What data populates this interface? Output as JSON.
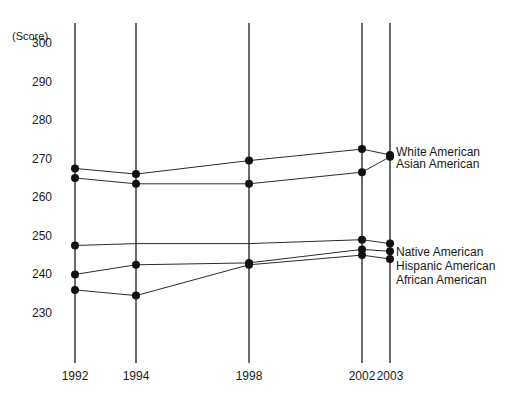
{
  "chart_data": {
    "type": "line",
    "title": "",
    "xlabel": "",
    "ylabel": "(Score)",
    "unit_label": "(Score)",
    "categories": [
      "1992",
      "1994",
      "1998",
      "2002",
      "2003"
    ],
    "x_tick_labels": [
      "1992",
      "1994",
      "1998",
      "2002",
      "2003"
    ],
    "y_tick_labels": [
      "300",
      "290",
      "280",
      "270",
      "260",
      "250",
      "240",
      "230"
    ],
    "y_ticks": [
      300,
      290,
      280,
      270,
      260,
      250,
      240,
      230
    ],
    "ylim": [
      226,
      303
    ],
    "xlim": [
      "1992",
      "2003"
    ],
    "grid": "vertical-axis-lines",
    "legend": "right-of-plot-inline",
    "marker": "filled-circle",
    "series": [
      {
        "name": "White American",
        "label": "White American",
        "x": [
          "1992",
          "1994",
          "1998",
          "2002",
          "2003"
        ],
        "values": [
          267.5,
          266.0,
          269.5,
          272.5,
          271.0
        ],
        "markers": [
          true,
          true,
          true,
          true,
          true
        ]
      },
      {
        "name": "Asian American",
        "label": "Asian American",
        "x": [
          "1992",
          "1994",
          "1998",
          "2002",
          "2003"
        ],
        "values": [
          265.0,
          263.5,
          263.5,
          266.5,
          270.5
        ],
        "markers": [
          true,
          true,
          true,
          true,
          true
        ]
      },
      {
        "name": "Native American",
        "label": "Native American",
        "x": [
          "1992",
          "1994",
          "1998",
          "2002",
          "2003"
        ],
        "values": [
          247.5,
          248.0,
          248.0,
          249.0,
          248.0
        ],
        "markers": [
          true,
          false,
          false,
          true,
          true
        ]
      },
      {
        "name": "Hispanic American",
        "label": "Hispanic American",
        "x": [
          "1992",
          "1994",
          "1998",
          "2002",
          "2003"
        ],
        "values": [
          240.0,
          242.5,
          243.0,
          246.5,
          246.0
        ],
        "markers": [
          true,
          true,
          true,
          true,
          true
        ]
      },
      {
        "name": "African American",
        "label": "African American",
        "x": [
          "1992",
          "1994",
          "1998",
          "2002",
          "2003"
        ],
        "values": [
          236.0,
          234.5,
          242.5,
          245.0,
          244.0
        ],
        "markers": [
          true,
          true,
          true,
          true,
          true
        ]
      }
    ],
    "series_labels_right": [
      "White American",
      "Asian American",
      "Native American",
      "Hispanic American",
      "African American"
    ],
    "colors": {
      "line": "#2b2b2b",
      "marker": "#111111",
      "axis": "#2b2b2b",
      "text": "#1a1a1a",
      "background": "#ffffff"
    }
  }
}
